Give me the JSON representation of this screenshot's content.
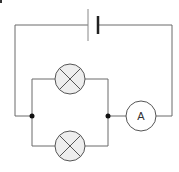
{
  "diagram": {
    "type": "circuit",
    "components": [
      {
        "id": "cell",
        "kind": "battery-cell",
        "label": ""
      },
      {
        "id": "lamp1",
        "kind": "lamp",
        "label": ""
      },
      {
        "id": "lamp2",
        "kind": "lamp",
        "label": ""
      },
      {
        "id": "ammeter",
        "kind": "ammeter",
        "label": "A"
      }
    ],
    "junctions": 2
  },
  "ammeter": {
    "label": "A"
  },
  "colors": {
    "wire": "#6b6b6b",
    "lamp_fill": "#eeeeee",
    "node": "#111111"
  }
}
